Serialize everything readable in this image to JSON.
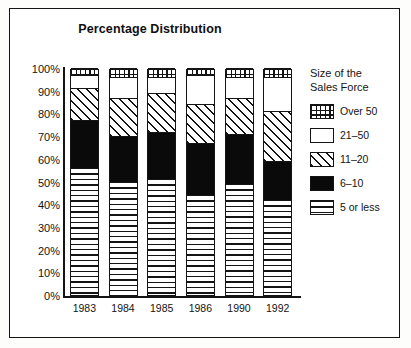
{
  "chart_data": {
    "type": "bar",
    "stacked": true,
    "stacked_mode": "percent",
    "title": "Percentage Distribution",
    "xlabel": "",
    "ylabel": "",
    "ylim": [
      0,
      100
    ],
    "yticks": [
      "0%",
      "10%",
      "20%",
      "30%",
      "40%",
      "50%",
      "60%",
      "70%",
      "80%",
      "90%",
      "100%"
    ],
    "ytick_values": [
      0,
      10,
      20,
      30,
      40,
      50,
      60,
      70,
      80,
      90,
      100
    ],
    "grid": false,
    "legend_position": "right",
    "legend_title": "Size of the\nSales Force",
    "categories": [
      "1983",
      "1984",
      "1985",
      "1986",
      "1990",
      "1992"
    ],
    "series": [
      {
        "name": "5 or less",
        "pattern": "horizontal-lines",
        "color": "#ffffff",
        "values": [
          56,
          50,
          51,
          44,
          49,
          42
        ]
      },
      {
        "name": "6–10",
        "pattern": "solid-black",
        "color": "#0a0a0a",
        "values": [
          21,
          20,
          21,
          23,
          22,
          17
        ]
      },
      {
        "name": "11–20",
        "pattern": "diagonal-hatch",
        "color": "#ffffff",
        "values": [
          14,
          17,
          17,
          17,
          16,
          22
        ]
      },
      {
        "name": "21–50",
        "pattern": "white",
        "color": "#ffffff",
        "values": [
          6,
          9,
          7,
          13,
          9,
          15
        ]
      },
      {
        "name": "Over 50",
        "pattern": "grid-crosshatch",
        "color": "#ffffff",
        "values": [
          3,
          4,
          4,
          3,
          4,
          4
        ]
      }
    ]
  },
  "legend": {
    "title_line1": "Size of the",
    "title_line2": "Sales Force",
    "entries": [
      {
        "label": "Over 50"
      },
      {
        "label": "21–50"
      },
      {
        "label": "11–20"
      },
      {
        "label": "6–10"
      },
      {
        "label": "5 or less"
      }
    ]
  }
}
